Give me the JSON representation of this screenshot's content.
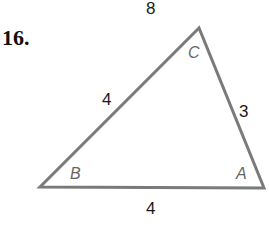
{
  "problem": {
    "number": "16."
  },
  "triangle": {
    "vertices": [
      {
        "name": "C",
        "x": 199,
        "y": 28
      },
      {
        "name": "B",
        "x": 40,
        "y": 187
      },
      {
        "name": "A",
        "x": 264,
        "y": 188
      }
    ],
    "vertex_labels": {
      "A": "A",
      "B": "B",
      "C": "C"
    },
    "side_labels": {
      "top": "8",
      "BC": "4",
      "CA": "3",
      "AB": "4"
    },
    "stroke_color": "#7a7a7a"
  }
}
